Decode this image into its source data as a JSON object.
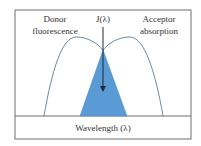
{
  "diagram": {
    "labels": {
      "donor": [
        "Donor",
        "fluorescence"
      ],
      "acceptor": [
        "Acceptor",
        "absorption"
      ],
      "overlap": "J(λ)",
      "xaxis": "Wavelength (λ)"
    },
    "colors": {
      "border": "#6e6e6e",
      "curve": "#5f7890",
      "overlap_fill": "#5b9bd5",
      "arrow": "#1a2a3a",
      "text": "#333333"
    }
  }
}
